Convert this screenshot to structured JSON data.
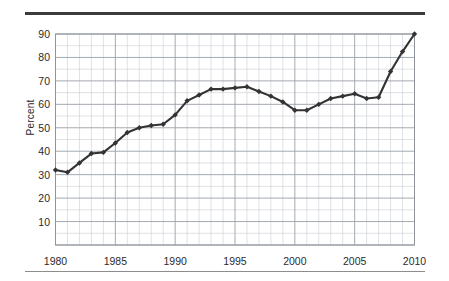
{
  "figure": {
    "background_color": "#ffffff",
    "top_rule_color": "#3b3b3b",
    "bottom_rule_color": "#8d8d8d"
  },
  "chart_data": {
    "type": "line",
    "title": "",
    "subtitle": "",
    "xlabel": "",
    "ylabel": "Percent",
    "xlim": [
      1980,
      2010
    ],
    "ylim": [
      0,
      90
    ],
    "yticks": [
      10,
      20,
      30,
      40,
      50,
      60,
      70,
      80,
      90
    ],
    "xticks": [
      1980,
      1985,
      1990,
      1995,
      2000,
      2005,
      2010
    ],
    "grid": true,
    "grid_minor_x": "every 1 year",
    "grid_minor_y": "every 5 percent",
    "legend": false,
    "legend_position": "none",
    "line_color": "#333333",
    "marker": "diamond",
    "marker_color": "#333333",
    "x": [
      1980,
      1981,
      1982,
      1983,
      1984,
      1985,
      1986,
      1987,
      1988,
      1989,
      1990,
      1991,
      1992,
      1993,
      1994,
      1995,
      1996,
      1997,
      1998,
      1999,
      2000,
      2001,
      2002,
      2003,
      2004,
      2005,
      2006,
      2007,
      2008,
      2009,
      2010
    ],
    "values": [
      32,
      31,
      35,
      39,
      39.5,
      43.5,
      48,
      50,
      51,
      51.5,
      55.5,
      61.5,
      64,
      66.5,
      66.5,
      67,
      67.5,
      65.5,
      63.5,
      61,
      57.5,
      57.5,
      60,
      62.5,
      63.5,
      64.5,
      62.5,
      63,
      74,
      82.5,
      90
    ],
    "categories": [
      "1980",
      "1981",
      "1982",
      "1983",
      "1984",
      "1985",
      "1986",
      "1987",
      "1988",
      "1989",
      "1990",
      "1991",
      "1992",
      "1993",
      "1994",
      "1995",
      "1996",
      "1997",
      "1998",
      "1999",
      "2000",
      "2001",
      "2002",
      "2003",
      "2004",
      "2005",
      "2006",
      "2007",
      "2008",
      "2009",
      "2010"
    ],
    "series": [
      {
        "name": "Percent",
        "values": [
          32,
          31,
          35,
          39,
          39.5,
          43.5,
          48,
          50,
          51,
          51.5,
          55.5,
          61.5,
          64,
          66.5,
          66.5,
          67,
          67.5,
          65.5,
          63.5,
          61,
          57.5,
          57.5,
          60,
          62.5,
          63.5,
          64.5,
          62.5,
          63,
          74,
          82.5,
          90
        ]
      }
    ],
    "annotations": []
  }
}
